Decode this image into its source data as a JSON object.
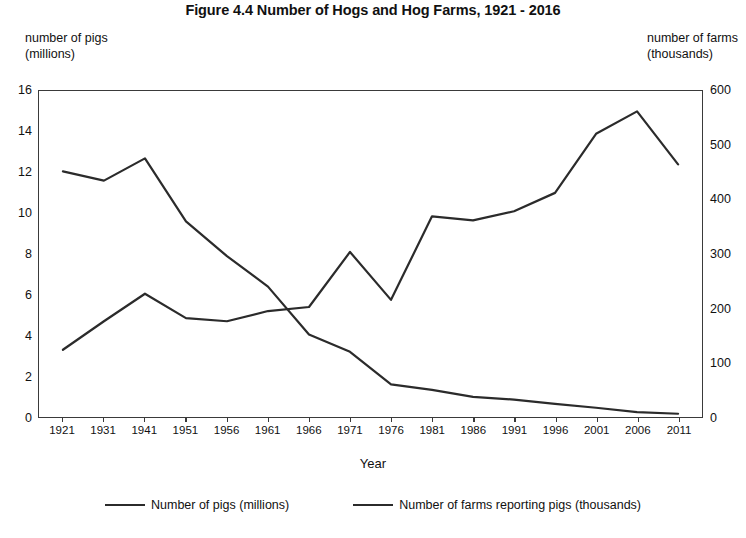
{
  "chart_data": {
    "type": "line",
    "title": "Figure 4.4 Number of Hogs and Hog Farms, 1921 - 2016",
    "xlabel": "Year",
    "ylabel_left": "number of pigs\n(millions)",
    "ylabel_right": "number of farms\n(thousands)",
    "categories": [
      "1921",
      "1931",
      "1941",
      "1951",
      "1956",
      "1961",
      "1966",
      "1971",
      "1976",
      "1981",
      "1986",
      "1991",
      "1996",
      "2001",
      "2006",
      "2011"
    ],
    "grid": false,
    "legend_position": "bottom",
    "ylim_left": [
      0,
      16
    ],
    "ylim_right": [
      0,
      600
    ],
    "ytick_left": [
      "0",
      "2",
      "4",
      "6",
      "8",
      "10",
      "12",
      "14",
      "16"
    ],
    "ytick_right": [
      "0",
      "100",
      "200",
      "300",
      "400",
      "500",
      "600"
    ],
    "series": [
      {
        "name": "Number of pigs (millions)",
        "axis": "left",
        "units": "millions",
        "values": [
          3.3,
          4.7,
          6.05,
          4.85,
          4.7,
          5.2,
          5.4,
          8.1,
          5.75,
          9.85,
          9.65,
          10.1,
          11.0,
          13.9,
          15.0,
          12.4
        ]
      },
      {
        "name": "Number of farms reporting pigs (thousands)",
        "axis": "right",
        "units": "thousands",
        "values": [
          452,
          435,
          476,
          360,
          296,
          240,
          152,
          120,
          60,
          50,
          37,
          32,
          24,
          17,
          9,
          6
        ]
      }
    ]
  },
  "legend": {
    "entries": [
      {
        "label": "Number of pigs (millions)"
      },
      {
        "label": "Number of farms reporting pigs (thousands)"
      }
    ]
  },
  "colors": {
    "line": "#2b2b2b",
    "axis": "#3a3a3a",
    "text": "#111111",
    "background": "#ffffff"
  }
}
